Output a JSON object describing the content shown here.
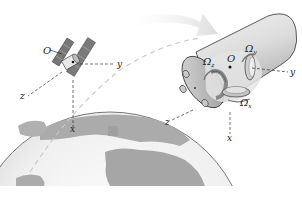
{
  "diagram": {
    "satellite": {
      "origin_label": "O",
      "axes": {
        "x": "x",
        "y": "y",
        "z": "z"
      }
    },
    "cylinder": {
      "origin_label": "O",
      "axes": {
        "x": "x",
        "y": "y",
        "z": "z"
      },
      "angular_velocities": {
        "omega_symbol": "Ω",
        "x_sub": "x",
        "y_sub": "y",
        "z_sub": "z"
      }
    },
    "colors": {
      "earth_ocean": "#f2f2f2",
      "earth_land": "#a8a8a8",
      "cylinder_body": "#d9d9d9",
      "arrow": "#e6e6e6",
      "ink": "#222222"
    }
  }
}
